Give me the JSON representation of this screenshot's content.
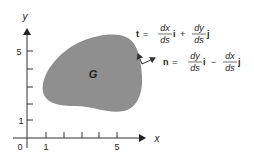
{
  "axes": {
    "x_label": "x",
    "y_label": "y",
    "origin_label": "0",
    "x_tick_labels": [
      "1",
      "",
      "",
      "",
      "5"
    ],
    "y_tick_labels": [
      "1",
      "",
      "",
      "",
      "5"
    ]
  },
  "region": {
    "label": "G",
    "fill_color": "#8f8f8f"
  },
  "equations": {
    "tangent": {
      "lhs": "t",
      "eq": "=",
      "term1_num": "dx",
      "term1_den": "ds",
      "term1_vec": "i",
      "op": "+",
      "term2_num": "dy",
      "term2_den": "ds",
      "term2_vec": "j"
    },
    "normal": {
      "lhs": "n",
      "eq": "=",
      "term1_num": "dy",
      "term1_den": "ds",
      "term1_vec": "i",
      "op": "−",
      "term2_num": "dx",
      "term2_den": "ds",
      "term2_vec": "j"
    }
  }
}
